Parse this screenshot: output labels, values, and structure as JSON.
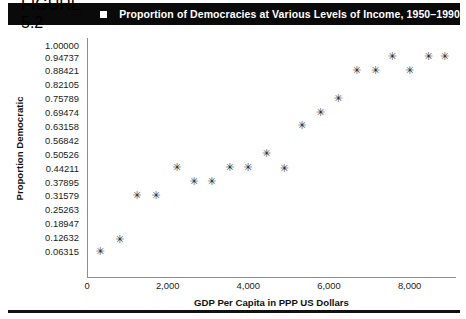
{
  "header": {
    "figure_number": "FIGURE 5.2",
    "bullet": "square-bullet",
    "title": "Proportion of Democracies at Various Levels of Income, 1950–1990"
  },
  "chart_data": {
    "type": "scatter",
    "title": "Proportion of Democracies at Various Levels of Income, 1950–1990",
    "xlabel": "GDP Per Capita in PPP US Dollars",
    "ylabel": "Proportion Democratic",
    "xlim": [
      0,
      9150
    ],
    "ylim": [
      0,
      1.0
    ],
    "grid": false,
    "legend": null,
    "marker": "asterisk",
    "marker_color": "#2b2b2b",
    "xticks": [
      0,
      2000,
      4000,
      6000,
      8000
    ],
    "xtick_labels": [
      "0",
      "2,000",
      "4,000",
      "6,000",
      "8,000"
    ],
    "yticks": [
      1.0,
      0.94737,
      0.88421,
      0.82105,
      0.75789,
      0.69474,
      0.63158,
      0.56842,
      0.50526,
      0.44211,
      0.37895,
      0.31579,
      0.25263,
      0.18947,
      0.12632,
      0.06315
    ],
    "ytick_labels": [
      "1.00000",
      "0.94737",
      "0.88421",
      "0.82105",
      "0.75789",
      "0.69474",
      "0.63158",
      "0.56842",
      "0.50526",
      "0.44211",
      "0.37895",
      "0.31579",
      "0.25263",
      "0.18947",
      "0.12632",
      "0.06315"
    ],
    "x": [
      300,
      780,
      1210,
      1680,
      2200,
      2620,
      3060,
      3510,
      3960,
      4420,
      4860,
      5300,
      5760,
      6200,
      6660,
      7120,
      7540,
      7970,
      8440,
      8840
    ],
    "y": [
      0.063,
      0.115,
      0.316,
      0.316,
      0.442,
      0.379,
      0.379,
      0.442,
      0.442,
      0.505,
      0.437,
      0.632,
      0.695,
      0.758,
      0.884,
      0.884,
      0.947,
      0.884,
      0.947,
      0.947
    ],
    "points": [
      {
        "x": 300,
        "y": 0.063
      },
      {
        "x": 780,
        "y": 0.115
      },
      {
        "x": 1210,
        "y": 0.316
      },
      {
        "x": 1680,
        "y": 0.316
      },
      {
        "x": 2200,
        "y": 0.442
      },
      {
        "x": 2620,
        "y": 0.379
      },
      {
        "x": 3060,
        "y": 0.379
      },
      {
        "x": 3510,
        "y": 0.442
      },
      {
        "x": 3960,
        "y": 0.442
      },
      {
        "x": 4420,
        "y": 0.505
      },
      {
        "x": 4860,
        "y": 0.437
      },
      {
        "x": 5300,
        "y": 0.632
      },
      {
        "x": 5760,
        "y": 0.695
      },
      {
        "x": 6200,
        "y": 0.758
      },
      {
        "x": 6660,
        "y": 0.884
      },
      {
        "x": 7120,
        "y": 0.884
      },
      {
        "x": 7540,
        "y": 0.947
      },
      {
        "x": 7970,
        "y": 0.884
      },
      {
        "x": 8440,
        "y": 0.947
      },
      {
        "x": 8840,
        "y": 0.947
      }
    ]
  }
}
